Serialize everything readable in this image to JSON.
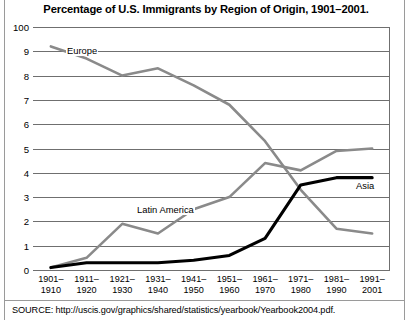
{
  "title": "Percentage of U.S. Immigrants by Region of Origin, 1901–2001.",
  "source": "SOURCE: http://uscis.gov/graphics/shared/statistics/yearbook/Yearbook2004.pdf.",
  "colors": {
    "europe": "#8a8a8a",
    "latin_america": "#8a8a8a",
    "asia": "#000000",
    "grid": "#6f6f6f",
    "text": "#000000",
    "rule": "#9a9a9a"
  },
  "chart_data": {
    "type": "line",
    "title": "Percentage of U.S. Immigrants by Region of Origin, 1901–2001.",
    "xlabel": "",
    "ylabel": "",
    "ylim": [
      0,
      100
    ],
    "grid": true,
    "legend": "inline-labels",
    "ytick_labels": [
      "100",
      "9",
      "8",
      "7",
      "6",
      "5",
      "4",
      "3",
      "2",
      "1",
      "0"
    ],
    "ytick_values": [
      100,
      90,
      80,
      70,
      60,
      50,
      40,
      30,
      20,
      10,
      0
    ],
    "categories": [
      "1901–1910",
      "1911–1920",
      "1921–1930",
      "1931–1940",
      "1941–1950",
      "1951–1960",
      "1961–1970",
      "1971–1980",
      "1981–1990",
      "1991–2001"
    ],
    "series": [
      {
        "name": "Europe",
        "color": "#8a8a8a",
        "values": [
          92,
          87,
          80,
          83,
          76,
          68,
          53,
          33,
          17,
          15
        ]
      },
      {
        "name": "Latin America",
        "color": "#8a8a8a",
        "values": [
          1,
          5,
          19,
          15,
          25,
          30,
          44,
          41,
          49,
          50
        ]
      },
      {
        "name": "Asia",
        "color": "#000000",
        "values": [
          1,
          3,
          3,
          3,
          4,
          6,
          13,
          35,
          38,
          38
        ]
      }
    ],
    "annotations": [
      {
        "text": "Europe",
        "series": "Europe",
        "x_px": 66,
        "y_px": 45
      },
      {
        "text": "Latin America",
        "series": "Latin America",
        "x_px": 136,
        "y_px": 204
      },
      {
        "text": "Asia",
        "series": "Asia",
        "x_px": 355,
        "y_px": 180
      }
    ]
  }
}
